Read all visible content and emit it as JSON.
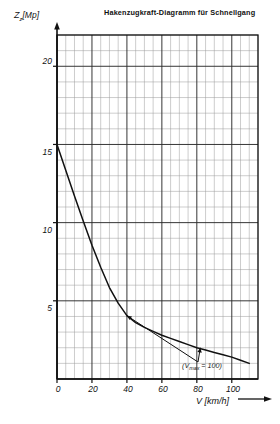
{
  "title": "Hakenzugkraft-Diagramm für Schnellgang",
  "axes": {
    "y_symbol": "Z",
    "y_subscript": "z",
    "y_unit": "[Mp]",
    "y_label_full": "Zz [Mp]",
    "x_label_full": "V [km/h]"
  },
  "annotation": {
    "prefix": "(V",
    "subscript": "max",
    "suffix": " = 100)",
    "full": "(Vmax = 100)"
  },
  "ticks": {
    "y": [
      "5",
      "10",
      "15",
      "20"
    ],
    "x": [
      "0",
      "20",
      "40",
      "60",
      "80",
      "100"
    ]
  },
  "colors": {
    "curve": "#111111",
    "grid_major": "#2b2b2b",
    "grid_minor": "#9a9a9a",
    "axis": "#111111",
    "background": "#ffffff"
  },
  "chart_data": {
    "type": "line",
    "title": "Hakenzugkraft-Diagramm für Schnellgang",
    "xlabel": "V [km/h]",
    "ylabel": "Zz [Mp]",
    "xlim": [
      0,
      115
    ],
    "ylim": [
      0,
      22
    ],
    "xticks": [
      0,
      20,
      40,
      60,
      80,
      100
    ],
    "yticks": [
      5,
      10,
      15,
      20
    ],
    "xtick_minor_step": 5,
    "ytick_minor_step": 1,
    "grid": true,
    "legend": false,
    "annotations": [
      {
        "text": "(Vmax = 100)",
        "x": 78,
        "y": 1.6,
        "points_to": [
          [
            40,
            4.05
          ],
          [
            82,
            2.0
          ]
        ]
      }
    ],
    "series": [
      {
        "name": "Hakenzugkraft",
        "x": [
          0,
          5,
          10,
          15,
          20,
          25,
          30,
          35,
          40,
          45,
          50,
          55,
          60,
          65,
          70,
          75,
          80,
          85,
          90,
          95,
          100,
          105,
          110
        ],
        "values": [
          15.0,
          13.35,
          11.7,
          10.1,
          8.55,
          7.15,
          5.85,
          4.85,
          4.05,
          3.6,
          3.3,
          3.05,
          2.8,
          2.6,
          2.4,
          2.2,
          2.0,
          1.85,
          1.7,
          1.55,
          1.4,
          1.2,
          1.0
        ]
      }
    ]
  },
  "layout": {
    "plot_left": 57,
    "plot_right": 258,
    "plot_top": 35,
    "plot_bottom": 379
  }
}
